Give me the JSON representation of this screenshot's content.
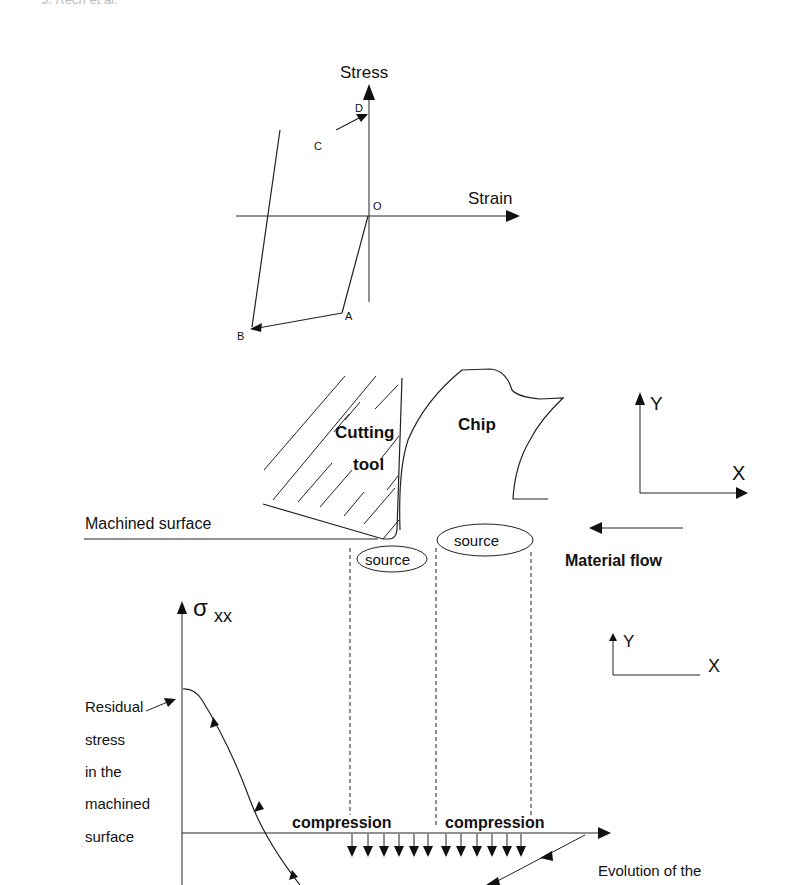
{
  "header": {
    "running_head": "J. Rech et al."
  },
  "stress_strain_diagram": {
    "y_axis_label": "Stress",
    "x_axis_label": "Strain",
    "points": {
      "O": "O",
      "A": "A",
      "B": "B",
      "C": "C",
      "D": "D"
    },
    "path_order": [
      "O",
      "A",
      "B",
      "C",
      "D"
    ]
  },
  "cutting_diagram": {
    "tool_label_line1": "Cutting",
    "tool_label_line2": "tool",
    "chip_label": "Chip",
    "machined_surface_label": "Machined surface",
    "source_left_label": "source",
    "source_right_label": "source",
    "material_flow_label": "Material flow",
    "axes": {
      "y_label": "Y",
      "x_label": "X"
    }
  },
  "residual_stress_plot": {
    "y_axis_label": "σ",
    "y_axis_subscript": "xx",
    "left_annotation_lines": [
      "Residual",
      "stress",
      "in the",
      "machined",
      "surface"
    ],
    "compression_left_label": "compression",
    "compression_right_label": "compression",
    "bottom_right_annotation": "Evolution of the",
    "axes": {
      "y_label": "Y",
      "x_label": "X"
    }
  },
  "colors": {
    "line": "#222222",
    "text": "#111111",
    "background": "#ffffff"
  }
}
